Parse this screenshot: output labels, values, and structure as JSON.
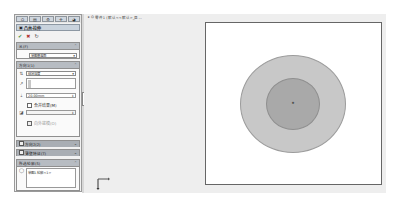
{
  "panel": {
    "tabs": [
      {
        "icon": "feature-manager-icon",
        "glyph": "⛭"
      },
      {
        "icon": "property-manager-icon",
        "glyph": "▤"
      },
      {
        "icon": "configuration-manager-icon",
        "glyph": "⚙"
      },
      {
        "icon": "dimxpert-icon",
        "glyph": "✛"
      },
      {
        "icon": "display-manager-icon",
        "glyph": "◕"
      }
    ],
    "title": "凸台-拉伸",
    "actions": {
      "ok": "✔",
      "cancel": "✖",
      "detail": "↻"
    },
    "from": {
      "header": "从(F)",
      "value": "草图基准面"
    },
    "direction1": {
      "header": "方向1(1)",
      "end_condition": "给定深度",
      "depth": "20.00mm",
      "merge_label": "合并结果(M)",
      "draft_outward_label": "向外拔模(O)"
    },
    "direction2": {
      "header": "方向2(2)"
    },
    "thin_feature": {
      "header": "薄壁特征(T)"
    },
    "selected_contours": {
      "header": "所选轮廓(S)",
      "item": "草图1-轮廓<1>"
    }
  },
  "graphics": {
    "breadcrumb": "零件1 (默认<<默认>_显...",
    "origin_label": "原点",
    "colors": {
      "background": "#eeeeee",
      "sheet": "#ffffff",
      "outer_circle": "#c8c8c8",
      "inner_circle": "#a9a9a9"
    }
  }
}
